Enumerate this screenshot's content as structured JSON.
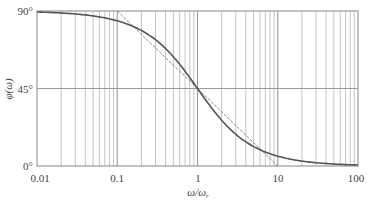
{
  "chart_data": {
    "type": "line",
    "title": "",
    "xlabel": "ω/ω_r",
    "xlabel_main": "ω/ω",
    "xlabel_sub": "r",
    "ylabel": "φ(ω)",
    "xscale": "log",
    "xlim": [
      0.01,
      100
    ],
    "ylim": [
      0,
      90
    ],
    "x_ticks": [
      {
        "value": 0.01,
        "label": "0.01"
      },
      {
        "value": 0.1,
        "label": "0.1"
      },
      {
        "value": 1,
        "label": "1"
      },
      {
        "value": 10,
        "label": "10"
      },
      {
        "value": 100,
        "label": "100"
      }
    ],
    "y_ticks": [
      {
        "value": 0,
        "label": "0°"
      },
      {
        "value": 45,
        "label": "45°"
      },
      {
        "value": 90,
        "label": "90°"
      }
    ],
    "grid": true,
    "legend": null,
    "series": [
      {
        "name": "phase",
        "style": "solid",
        "x": [
          0.01,
          0.02,
          0.05,
          0.1,
          0.2,
          0.3,
          0.5,
          0.7,
          1,
          1.5,
          2,
          3,
          5,
          7,
          10,
          20,
          50,
          100
        ],
        "values": [
          89.4,
          88.9,
          87.1,
          84.3,
          78.7,
          73.3,
          63.4,
          55.0,
          45.0,
          33.7,
          26.6,
          18.4,
          11.3,
          8.1,
          5.7,
          2.9,
          1.1,
          0.6
        ]
      },
      {
        "name": "asymptotic approximation",
        "style": "dashed",
        "x": [
          0.1,
          1,
          10
        ],
        "values": [
          90,
          45,
          0
        ]
      }
    ]
  },
  "labels": {
    "y90": "90°",
    "y45": "45°",
    "y0": "0°",
    "x001": "0.01",
    "x01": "0.1",
    "x1": "1",
    "x10": "10",
    "x100": "100",
    "ylabel": "φ(ω)",
    "xlabel_main": "ω/ω",
    "xlabel_sub": "r"
  },
  "colors": {
    "grid": "#b5b5b5",
    "frame": "#9a9a9a",
    "curve": "#555555",
    "asymptote": "#777777",
    "text": "#444444"
  }
}
